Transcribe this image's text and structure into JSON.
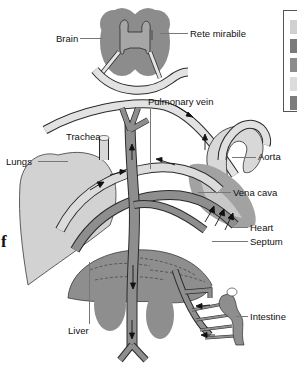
{
  "diagram": {
    "title": "",
    "labels": {
      "brain": "Brain",
      "rete_mirabile": "Rete mirabile",
      "pulmonary_vein": "Pulmonary vein",
      "trachea": "Trachea",
      "lungs": "Lungs",
      "aorta": "Aorta",
      "vena_cava": "Vena cava",
      "heart": "Heart",
      "septum": "Septum",
      "liver": "Liver",
      "intestine": "Intestine"
    },
    "edge_text": "f",
    "legend": {
      "swatches": [
        {
          "color": "#d0d0d0"
        },
        {
          "color": "#7a7a7a"
        },
        {
          "color": "#8c8c8c"
        },
        {
          "color": "#dcdcdc"
        },
        {
          "color": "#7c7c7c"
        }
      ]
    },
    "colors": {
      "dark_tissue": "#8a8a8a",
      "mid_tissue": "#9e9e9e",
      "light_tissue": "#cfcfcf",
      "vessel_dark": "#8f8f8f",
      "vessel_light": "#dedede",
      "outline": "#2a2a2a",
      "arrow": "#111111"
    }
  }
}
